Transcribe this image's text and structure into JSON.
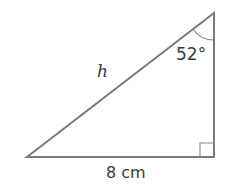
{
  "diagram": {
    "type": "right-triangle",
    "vertices": {
      "bottom_left": [
        27,
        157
      ],
      "bottom_right": [
        214,
        157
      ],
      "top_right": [
        214,
        13
      ]
    },
    "right_angle_at": "bottom_right",
    "stroke_color": "#7a7a7a",
    "labels": {
      "angle": "52°",
      "hypotenuse": "h",
      "base": "8 cm"
    },
    "marks": {
      "angle_arc_at": "top_right",
      "right_angle_box_at": "bottom_right"
    }
  }
}
